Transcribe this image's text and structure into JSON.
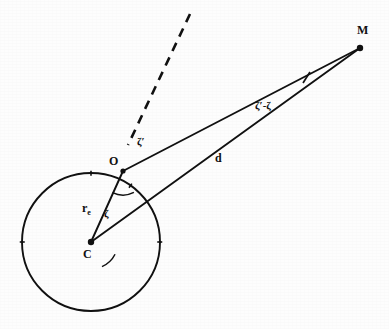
{
  "figure": {
    "background_color": "#fdfdfd",
    "ink_color": "#111111",
    "points": [
      {
        "id": "M",
        "label": "M",
        "x": 360,
        "y": 48,
        "label_x": 357,
        "label_y": 24,
        "dot_radius": 3.2
      },
      {
        "id": "O",
        "label": "O",
        "x": 123,
        "y": 171,
        "label_x": 109,
        "label_y": 155,
        "dot_radius": 2.6
      },
      {
        "id": "C",
        "label": "C",
        "x": 91,
        "y": 242,
        "label_x": 83,
        "label_y": 248,
        "dot_radius": 3.2
      }
    ],
    "circle": {
      "name": "earth-circle",
      "cx": 91,
      "cy": 242,
      "r": 69,
      "stroke_width": 1.9,
      "tick_angles_deg": [
        90,
        180,
        0,
        55
      ],
      "tick_length": 5
    },
    "segments": [
      {
        "id": "CO",
        "from": "C",
        "to": "O",
        "width": 1.9
      },
      {
        "id": "CM",
        "from": "C",
        "to": "M",
        "width": 1.9
      },
      {
        "id": "OM",
        "from": "O",
        "to": "M",
        "width": 1.9
      }
    ],
    "dashed_line": {
      "name": "zenith-direction-dashed",
      "x1": 190,
      "y1": 14,
      "x2": 128,
      "y2": 145,
      "width": 2.6,
      "dash": "9 7"
    },
    "perpendicular_mark": {
      "name": "right-angle-tick",
      "x1": 303,
      "y1": 83,
      "x2": 310,
      "y2": 72,
      "width": 1.7
    },
    "angle_arcs": [
      {
        "id": "zeta-at-C",
        "cx": 91,
        "cy": 242,
        "r": 27,
        "start_deg": 294,
        "end_deg": 333
      },
      {
        "id": "zeta-prime-at-O",
        "cx": 123,
        "cy": 171,
        "r": 24,
        "start_deg": 244,
        "end_deg": 297
      }
    ],
    "labels": [
      {
        "id": "radius-label",
        "text": "r",
        "sub": "e",
        "x": 82,
        "y": 202,
        "kind": "seg"
      },
      {
        "id": "distance-label",
        "text": "d",
        "sub": "",
        "x": 215,
        "y": 152,
        "kind": "seg"
      },
      {
        "id": "zeta-label",
        "text": "ζ",
        "sub": "",
        "x": 104,
        "y": 208,
        "kind": "ang"
      },
      {
        "id": "zeta-prime-label",
        "text": "ζ′",
        "sub": "",
        "x": 137,
        "y": 136,
        "kind": "ang"
      },
      {
        "id": "parallax-label",
        "text": "ζ′-ζ",
        "sub": "",
        "x": 255,
        "y": 100,
        "kind": "ang"
      }
    ]
  }
}
